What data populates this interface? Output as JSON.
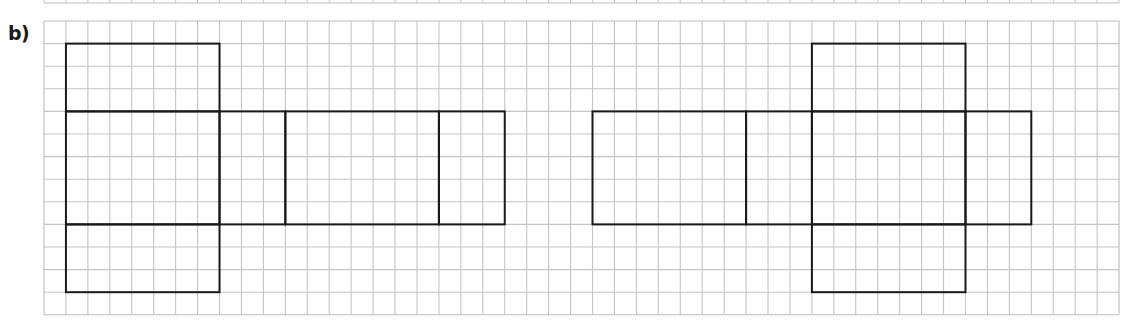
{
  "label": "b)",
  "grid": {
    "x0": 44,
    "y0": 21,
    "cols": 49,
    "rows": 13,
    "cell_w": 21.94,
    "cell_h": 22.6,
    "line_color": "#c4c4c4",
    "border_color": "#bdbdbd",
    "top_strip": {
      "y_bottom": 3
    }
  },
  "shape_color": "#1a1a1a",
  "nets": [
    {
      "name": "left-net",
      "rects": [
        {
          "c0": 1,
          "r0": 1,
          "c1": 8,
          "r1": 4
        },
        {
          "c0": 1,
          "r0": 4,
          "c1": 8,
          "r1": 9
        },
        {
          "c0": 8,
          "r0": 4,
          "c1": 11,
          "r1": 9
        },
        {
          "c0": 11,
          "r0": 4,
          "c1": 18,
          "r1": 9
        },
        {
          "c0": 18,
          "r0": 4,
          "c1": 21,
          "r1": 9
        },
        {
          "c0": 1,
          "r0": 9,
          "c1": 8,
          "r1": 12
        }
      ]
    },
    {
      "name": "right-net",
      "rects": [
        {
          "c0": 25,
          "r0": 4,
          "c1": 32,
          "r1": 9
        },
        {
          "c0": 32,
          "r0": 4,
          "c1": 35,
          "r1": 9
        },
        {
          "c0": 35,
          "r0": 4,
          "c1": 42,
          "r1": 9
        },
        {
          "c0": 42,
          "r0": 4,
          "c1": 45,
          "r1": 9
        },
        {
          "c0": 35,
          "r0": 1,
          "c1": 42,
          "r1": 4
        },
        {
          "c0": 35,
          "r0": 9,
          "c1": 42,
          "r1": 12
        }
      ]
    }
  ]
}
